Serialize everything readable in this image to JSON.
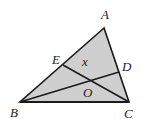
{
  "diagram": {
    "type": "geometry-triangle",
    "fill_color": "#cfcfcf",
    "stroke_color": "#1a1a1a",
    "vertices": {
      "A": [
        104,
        28
      ],
      "B": [
        20,
        102
      ],
      "C": [
        129,
        102
      ]
    },
    "points": {
      "E": [
        63,
        65
      ],
      "D": [
        119,
        72
      ],
      "O": [
        90,
        80
      ]
    },
    "segments": [
      [
        "A",
        "B"
      ],
      [
        "B",
        "C"
      ],
      [
        "C",
        "A"
      ],
      [
        "B",
        "D"
      ],
      [
        "C",
        "E"
      ]
    ],
    "labels": {
      "A": "A",
      "B": "B",
      "C": "C",
      "D": "D",
      "E": "E",
      "O": "O",
      "x": "x"
    }
  }
}
